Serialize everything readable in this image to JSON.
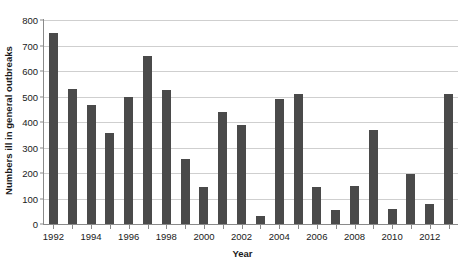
{
  "chart_data": {
    "type": "bar",
    "title": "",
    "xlabel": "Year",
    "ylabel": "Numbers ill in general outbreaks",
    "ylim": [
      0,
      800
    ],
    "ytick_step": 100,
    "yticks": [
      "0",
      "100",
      "200",
      "300",
      "400",
      "500",
      "600",
      "700",
      "800"
    ],
    "grid": true,
    "legend": false,
    "bar_color": "#4a4a4a",
    "axis_color": "#8a8a8a",
    "grid_color": "#cfcfcf",
    "categories": [
      "1992",
      "1993",
      "1994",
      "1995",
      "1996",
      "1997",
      "1998",
      "1999",
      "2000",
      "2001",
      "2002",
      "2003",
      "2004",
      "2005",
      "2006",
      "2007",
      "2008",
      "2009",
      "2010",
      "2011",
      "2012",
      "2013"
    ],
    "values": [
      750,
      530,
      465,
      355,
      500,
      660,
      525,
      255,
      145,
      440,
      390,
      30,
      490,
      510,
      145,
      55,
      150,
      370,
      60,
      195,
      80,
      510
    ],
    "xtick_labels": [
      "1992",
      "1994",
      "1996",
      "1998",
      "2000",
      "2002",
      "2004",
      "2006",
      "2008",
      "2010",
      "2012"
    ],
    "xtick_categories": [
      "1992",
      "1994",
      "1996",
      "1998",
      "2000",
      "2002",
      "2004",
      "2006",
      "2008",
      "2010",
      "2012"
    ]
  }
}
